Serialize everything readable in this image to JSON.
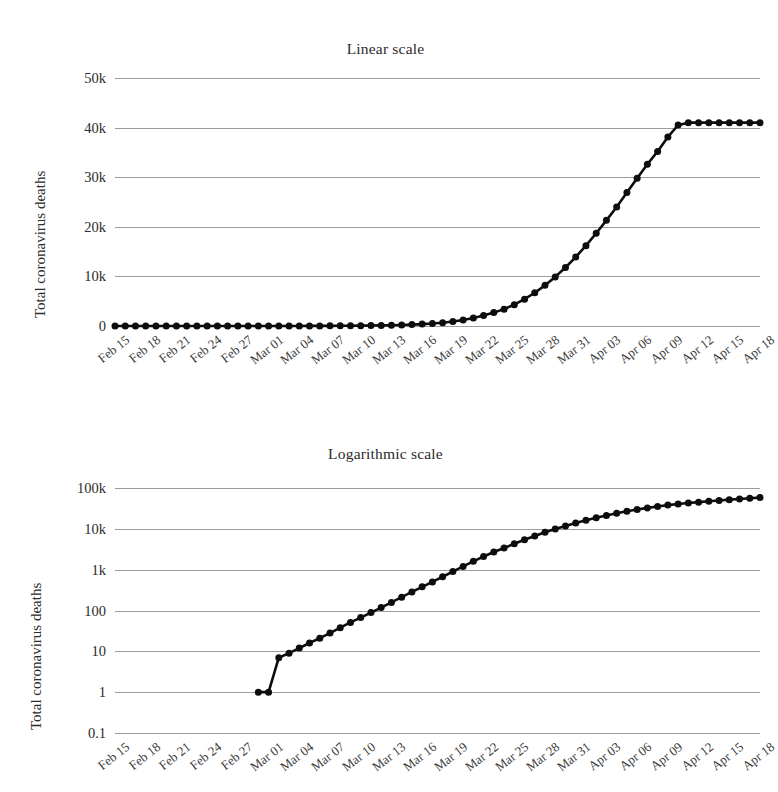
{
  "figure": {
    "ylabel": "Total coronavirus deaths"
  },
  "chart_data": [
    {
      "type": "line",
      "title": "Linear scale",
      "xlabel": "",
      "ylabel": "Total coronavirus deaths",
      "scale": "linear",
      "ylim": [
        0,
        50000
      ],
      "yticks": [
        0,
        10000,
        20000,
        30000,
        40000,
        50000
      ],
      "ytick_labels": [
        "0",
        "10k",
        "20k",
        "30k",
        "40k",
        "50k"
      ],
      "grid": true,
      "legend": "none",
      "x": [
        "Feb 15",
        "Feb 16",
        "Feb 17",
        "Feb 18",
        "Feb 19",
        "Feb 20",
        "Feb 21",
        "Feb 22",
        "Feb 23",
        "Feb 24",
        "Feb 25",
        "Feb 26",
        "Feb 27",
        "Feb 28",
        "Feb 29",
        "Mar 01",
        "Mar 02",
        "Mar 03",
        "Mar 04",
        "Mar 05",
        "Mar 06",
        "Mar 07",
        "Mar 08",
        "Mar 09",
        "Mar 10",
        "Mar 11",
        "Mar 12",
        "Mar 13",
        "Mar 14",
        "Mar 15",
        "Mar 16",
        "Mar 17",
        "Mar 18",
        "Mar 19",
        "Mar 20",
        "Mar 21",
        "Mar 22",
        "Mar 23",
        "Mar 24",
        "Mar 25",
        "Mar 26",
        "Mar 27",
        "Mar 28",
        "Mar 29",
        "Mar 30",
        "Mar 31",
        "Apr 01",
        "Apr 02",
        "Apr 03",
        "Apr 04",
        "Apr 05",
        "Apr 06",
        "Apr 07",
        "Apr 08",
        "Apr 09",
        "Apr 10",
        "Apr 11",
        "Apr 12",
        "Apr 13",
        "Apr 14",
        "Apr 15",
        "Apr 16",
        "Apr 17",
        "Apr 18"
      ],
      "xtick_labels": [
        "Feb 15",
        "Feb 18",
        "Feb 21",
        "Feb 24",
        "Feb 27",
        "Mar 01",
        "Mar 04",
        "Mar 07",
        "Mar 10",
        "Mar 13",
        "Mar 16",
        "Mar 19",
        "Mar 22",
        "Mar 25",
        "Mar 28",
        "Mar 31",
        "Apr 03",
        "Apr 06",
        "Apr 09",
        "Apr 12",
        "Apr 15",
        "Apr 18"
      ],
      "xtick_indices": [
        0,
        3,
        6,
        9,
        12,
        15,
        18,
        21,
        24,
        27,
        30,
        33,
        36,
        39,
        42,
        45,
        48,
        51,
        54,
        57,
        60,
        63
      ],
      "values": [
        0,
        0,
        0,
        0,
        0,
        0,
        0,
        0,
        0,
        0,
        0,
        0,
        0,
        0,
        1,
        1,
        7,
        9,
        12,
        16,
        21,
        28,
        38,
        51,
        67,
        89,
        118,
        158,
        212,
        285,
        380,
        500,
        670,
        900,
        1200,
        1600,
        2100,
        2700,
        3400,
        4300,
        5400,
        6700,
        8200,
        9900,
        11800,
        13900,
        16200,
        18700,
        21300,
        24000,
        26900,
        29800,
        32600,
        35200,
        38100,
        40500,
        43000,
        45000,
        47200,
        49500,
        51800,
        54000,
        56100,
        58200
      ],
      "values_plotted_note": "curve ends just above 40k gridline",
      "marker": "circle",
      "color": "#0d0d0d"
    },
    {
      "type": "line",
      "title": "Logarithmic scale",
      "xlabel": "",
      "ylabel": "Total coronavirus deaths",
      "scale": "log",
      "ylim": [
        0.1,
        100000
      ],
      "yticks": [
        0.1,
        1,
        10,
        100,
        1000,
        10000,
        100000
      ],
      "ytick_labels": [
        "0.1",
        "1",
        "10",
        "100",
        "1k",
        "10k",
        "100k"
      ],
      "grid": true,
      "legend": "none",
      "x": [
        "Feb 15",
        "Feb 16",
        "Feb 17",
        "Feb 18",
        "Feb 19",
        "Feb 20",
        "Feb 21",
        "Feb 22",
        "Feb 23",
        "Feb 24",
        "Feb 25",
        "Feb 26",
        "Feb 27",
        "Feb 28",
        "Feb 29",
        "Mar 01",
        "Mar 02",
        "Mar 03",
        "Mar 04",
        "Mar 05",
        "Mar 06",
        "Mar 07",
        "Mar 08",
        "Mar 09",
        "Mar 10",
        "Mar 11",
        "Mar 12",
        "Mar 13",
        "Mar 14",
        "Mar 15",
        "Mar 16",
        "Mar 17",
        "Mar 18",
        "Mar 19",
        "Mar 20",
        "Mar 21",
        "Mar 22",
        "Mar 23",
        "Mar 24",
        "Mar 25",
        "Mar 26",
        "Mar 27",
        "Mar 28",
        "Mar 29",
        "Mar 30",
        "Mar 31",
        "Apr 01",
        "Apr 02",
        "Apr 03",
        "Apr 04",
        "Apr 05",
        "Apr 06",
        "Apr 07",
        "Apr 08",
        "Apr 09",
        "Apr 10",
        "Apr 11",
        "Apr 12",
        "Apr 13",
        "Apr 14",
        "Apr 15",
        "Apr 16",
        "Apr 17",
        "Apr 18"
      ],
      "xtick_labels": [
        "Feb 15",
        "Feb 18",
        "Feb 21",
        "Feb 24",
        "Feb 27",
        "Mar 01",
        "Mar 04",
        "Mar 07",
        "Mar 10",
        "Mar 13",
        "Mar 16",
        "Mar 19",
        "Mar 22",
        "Mar 25",
        "Mar 28",
        "Mar 31",
        "Apr 03",
        "Apr 06",
        "Apr 09",
        "Apr 12",
        "Apr 15",
        "Apr 18"
      ],
      "xtick_indices": [
        0,
        3,
        6,
        9,
        12,
        15,
        18,
        21,
        24,
        27,
        30,
        33,
        36,
        39,
        42,
        45,
        48,
        51,
        54,
        57,
        60,
        63
      ],
      "values": [
        null,
        null,
        null,
        null,
        null,
        null,
        null,
        null,
        null,
        null,
        null,
        null,
        null,
        null,
        1,
        1,
        7,
        9,
        12,
        16,
        21,
        28,
        38,
        51,
        67,
        89,
        118,
        158,
        212,
        285,
        380,
        500,
        670,
        900,
        1200,
        1600,
        2100,
        2700,
        3400,
        4300,
        5400,
        6700,
        8200,
        9900,
        11800,
        13900,
        16200,
        18700,
        21300,
        24000,
        26900,
        29800,
        32600,
        35200,
        38100,
        40500,
        43000,
        45000,
        47200,
        49500,
        51800,
        54000,
        56100,
        58200
      ],
      "series_start_index": 14,
      "marker": "circle",
      "color": "#0d0d0d"
    }
  ]
}
